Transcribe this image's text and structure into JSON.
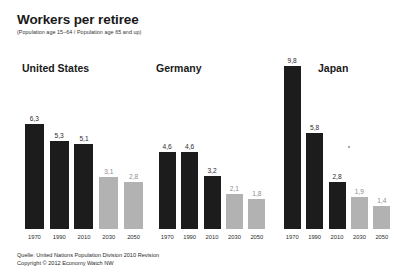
{
  "header": {
    "title": "Workers per retiree",
    "subtitle": "(Population age 15–64 / Population age 65 and up)"
  },
  "footer": {
    "source": "Quelle: United Nations Population Division 2010 Revision",
    "copyright": "Copyright © 2012 Economy Watch NW"
  },
  "colors": {
    "historical_bar": "#1c1c1c",
    "projected_bar": "#b2b2b2",
    "historical_label": "#2b2b2b",
    "projected_label": "#8d8d8d",
    "background": "#ffffff"
  },
  "chart_data": {
    "type": "bar",
    "title": "Workers per retiree",
    "subtitle": "(Population age 15–64 / Population age 65 and up)",
    "xlabel": "",
    "ylabel": "Workers per retiree",
    "ylim": [
      0,
      9.8
    ],
    "grid": false,
    "legend": "none",
    "decimal_separator": ",",
    "categories": [
      "1970",
      "1990",
      "2010",
      "2030",
      "2050"
    ],
    "panels": [
      {
        "name": "United States",
        "values": [
          6.3,
          5.3,
          5.1,
          3.1,
          2.8
        ],
        "labels": [
          "6,3",
          "5,3",
          "5,1",
          "3,1",
          "2,8"
        ],
        "kinds": [
          "historical",
          "historical",
          "historical",
          "projected",
          "projected"
        ]
      },
      {
        "name": "Germany",
        "values": [
          4.6,
          4.6,
          3.2,
          2.1,
          1.8
        ],
        "labels": [
          "4,6",
          "4,6",
          "3,2",
          "2,1",
          "1,8"
        ],
        "kinds": [
          "historical",
          "historical",
          "historical",
          "projected",
          "projected"
        ]
      },
      {
        "name": "Japan",
        "values": [
          9.8,
          5.8,
          2.8,
          1.9,
          1.4
        ],
        "labels": [
          "9,8",
          "5,8",
          "2,8",
          "1,9",
          "1,4"
        ],
        "kinds": [
          "historical",
          "historical",
          "historical",
          "projected",
          "projected"
        ]
      }
    ]
  }
}
